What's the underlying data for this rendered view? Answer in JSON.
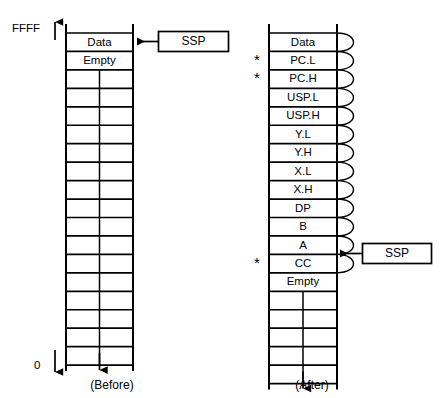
{
  "diagram": {
    "axis": {
      "top_label": "FFFF",
      "bottom_label": "0"
    },
    "colors": {
      "stroke": "#000000",
      "background": "#ffffff"
    },
    "before": {
      "caption": "(Before)",
      "pointer_label": "SSP",
      "pointer_target_row": 0,
      "rows": [
        {
          "label": "Data",
          "divided": false,
          "star": false
        },
        {
          "label": "Empty",
          "divided": false,
          "star": false
        },
        {
          "label": "",
          "divided": true,
          "star": false
        },
        {
          "label": "",
          "divided": true,
          "star": false
        },
        {
          "label": "",
          "divided": true,
          "star": false
        },
        {
          "label": "",
          "divided": true,
          "star": false
        },
        {
          "label": "",
          "divided": true,
          "star": false
        },
        {
          "label": "",
          "divided": true,
          "star": false
        },
        {
          "label": "",
          "divided": true,
          "star": false
        },
        {
          "label": "",
          "divided": true,
          "star": false
        },
        {
          "label": "",
          "divided": true,
          "star": false
        },
        {
          "label": "",
          "divided": true,
          "star": false
        },
        {
          "label": "",
          "divided": true,
          "star": false
        },
        {
          "label": "",
          "divided": true,
          "star": false
        },
        {
          "label": "",
          "divided": true,
          "star": false
        },
        {
          "label": "",
          "divided": true,
          "star": false
        },
        {
          "label": "",
          "divided": true,
          "star": false
        },
        {
          "label": "",
          "divided": true,
          "star": false
        }
      ]
    },
    "after": {
      "caption": "(After)",
      "pointer_label": "SSP",
      "pointer_target_row": 12,
      "brace_from_row": 0,
      "brace_to_row": 12,
      "star_glyph": "*",
      "rows": [
        {
          "label": "Data",
          "divided": false,
          "star": false
        },
        {
          "label": "PC.L",
          "divided": false,
          "star": true
        },
        {
          "label": "PC.H",
          "divided": false,
          "star": true
        },
        {
          "label": "USP.L",
          "divided": false,
          "star": false
        },
        {
          "label": "USP.H",
          "divided": false,
          "star": false
        },
        {
          "label": "Y.L",
          "divided": false,
          "star": false
        },
        {
          "label": "Y.H",
          "divided": false,
          "star": false
        },
        {
          "label": "X.L",
          "divided": false,
          "star": false
        },
        {
          "label": "X.H",
          "divided": false,
          "star": false
        },
        {
          "label": "DP",
          "divided": false,
          "star": false
        },
        {
          "label": "B",
          "divided": false,
          "star": false
        },
        {
          "label": "A",
          "divided": false,
          "star": false
        },
        {
          "label": "CC",
          "divided": false,
          "star": true
        },
        {
          "label": "Empty",
          "divided": false,
          "star": false
        },
        {
          "label": "",
          "divided": true,
          "star": false
        },
        {
          "label": "",
          "divided": true,
          "star": false
        },
        {
          "label": "",
          "divided": true,
          "star": false
        },
        {
          "label": "",
          "divided": true,
          "star": false
        },
        {
          "label": "",
          "divided": true,
          "star": false
        }
      ]
    }
  }
}
